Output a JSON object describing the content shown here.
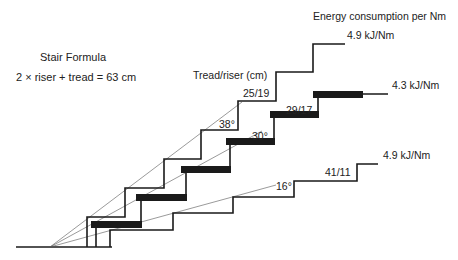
{
  "title": {
    "formula_heading": "Stair Formula",
    "formula": "2 × riser + tread = 63 cm",
    "energy_heading": "Energy consumption per Nm",
    "tread_riser_heading": "Tread/riser (cm)"
  },
  "colors": {
    "line": "#1a1a1a",
    "ray": "#555555",
    "text": "#222222",
    "background": "#ffffff"
  },
  "stairs": [
    {
      "name": "steep",
      "dimensions": "25/19",
      "angle": "38°",
      "energy": "4.9 kJ/Nm",
      "style": "line"
    },
    {
      "name": "comfortable",
      "dimensions": "29/17",
      "angle": "30°",
      "energy": "4.3 kJ/Nm",
      "style": "thick-treads"
    },
    {
      "name": "shallow",
      "dimensions": "41/11",
      "angle": "16°",
      "energy": "4.9 kJ/Nm",
      "style": "line"
    }
  ]
}
